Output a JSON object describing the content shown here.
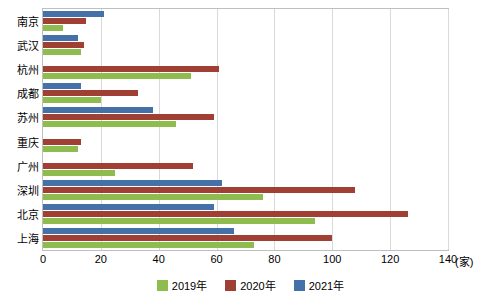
{
  "chart_data": {
    "type": "bar",
    "orientation": "horizontal",
    "title": "",
    "xlabel": "(家)",
    "ylabel": "",
    "xlim": [
      0,
      140
    ],
    "xticks": [
      0,
      20,
      40,
      60,
      80,
      100,
      120,
      140
    ],
    "grid": true,
    "legend_position": "bottom",
    "categories": [
      "上海",
      "北京",
      "深圳",
      "广州",
      "重庆",
      "苏州",
      "成都",
      "杭州",
      "武汉",
      "南京"
    ],
    "series": [
      {
        "name": "2021年",
        "color": "#4472a8",
        "values": [
          66,
          59,
          62,
          0,
          0,
          38,
          13,
          0,
          12,
          21
        ]
      },
      {
        "name": "2020年",
        "color": "#a03f34",
        "values": [
          100,
          126,
          108,
          52,
          13,
          59,
          33,
          61,
          14,
          15
        ]
      },
      {
        "name": "2019年",
        "color": "#8fbc4f",
        "values": [
          73,
          94,
          76,
          25,
          12,
          46,
          20,
          51,
          13,
          7
        ]
      }
    ]
  },
  "legend": {
    "items": [
      {
        "label": "2019年",
        "color": "#8fbc4f"
      },
      {
        "label": "2020年",
        "color": "#a03f34"
      },
      {
        "label": "2021年",
        "color": "#4472a8"
      }
    ]
  },
  "axis": {
    "unit": "(家)",
    "ticks": [
      "0",
      "20",
      "40",
      "60",
      "80",
      "100",
      "120",
      "140"
    ]
  }
}
